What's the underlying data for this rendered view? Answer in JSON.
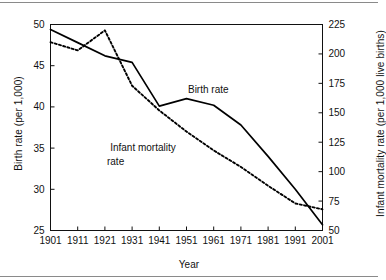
{
  "chart_data": {
    "type": "line",
    "title": "",
    "subtitle": "",
    "xlabel": "Year",
    "ylabel": "Birth rate (per 1,000)",
    "ylabel_right": "Infant mortality rate (per 1,000 live births)",
    "x": [
      1901,
      1911,
      1921,
      1931,
      1941,
      1951,
      1961,
      1971,
      1981,
      1991,
      2001
    ],
    "xlim": [
      1901,
      2001
    ],
    "ylim": [
      25,
      50
    ],
    "ylim_right": [
      50,
      225
    ],
    "xticks": [
      "1901",
      "1911",
      "1921",
      "1931",
      "1941",
      "1951",
      "1961",
      "1971",
      "1981",
      "1991",
      "2001"
    ],
    "yticks": [
      "25",
      "30",
      "35",
      "40",
      "45",
      "50"
    ],
    "yticks_right": [
      "50",
      "75",
      "100",
      "125",
      "150",
      "175",
      "200",
      "225"
    ],
    "grid": false,
    "legend_position": "inline-annotation",
    "series": [
      {
        "name": "Birth rate",
        "axis": "left",
        "style": "solid",
        "color": "#000000",
        "label_text": "Birth rate",
        "values": [
          49.4,
          47.8,
          46.2,
          45.4,
          40.1,
          41.0,
          40.2,
          37.8,
          34.0,
          30.0,
          25.7
        ]
      },
      {
        "name": "Infant mortality rate",
        "axis": "right",
        "style": "dotted",
        "color": "#000000",
        "label_text_line1": "Infant mortality",
        "label_text_line2": "rate",
        "values": [
          210,
          203,
          220,
          173,
          152,
          134,
          118,
          104,
          88,
          73,
          68
        ]
      }
    ],
    "annotations": [
      {
        "text": "Birth rate",
        "x": 1959,
        "y": 41.7
      },
      {
        "text": "Infant mortality",
        "x": 1935,
        "y": 34.6
      },
      {
        "text": "rate",
        "x": 1935,
        "y": 33.0
      }
    ]
  }
}
